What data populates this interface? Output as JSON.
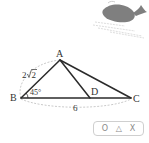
{
  "figure": {
    "vertices": {
      "A": "A",
      "B": "B",
      "C": "C",
      "D": "D"
    },
    "labels": {
      "AB_length": "2√2",
      "AB_coef": "2",
      "AB_radicand": "2",
      "angle_B": "45°",
      "BC_length": "6"
    },
    "colors": {
      "line": "#2b2b2b",
      "dashed": "#bdbdbd",
      "whale": "#7f7f7f"
    }
  },
  "answer_choices": {
    "o": "O",
    "triangle": "△",
    "x": "X"
  },
  "decoration": {
    "icon": "whale-icon"
  }
}
